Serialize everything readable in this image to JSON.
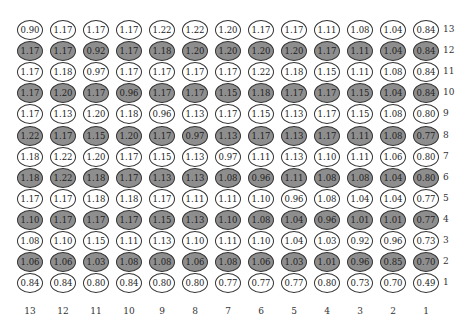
{
  "chart_data": {
    "type": "heatmap",
    "title": "",
    "column_labels": [
      "13",
      "12",
      "11",
      "10",
      "9",
      "8",
      "7",
      "6",
      "5",
      "4",
      "3",
      "2",
      "1"
    ],
    "row_labels": [
      "13",
      "12",
      "11",
      "10",
      "9",
      "8",
      "7",
      "6",
      "5",
      "4",
      "3",
      "2",
      "1"
    ],
    "shaded_rows": [
      "12",
      "10",
      "8",
      "6",
      "4",
      "2"
    ],
    "rows": [
      {
        "label": "13",
        "shaded": false,
        "values": [
          "0.90",
          "1.17",
          "1.17",
          "1.17",
          "1.22",
          "1.22",
          "1.20",
          "1.17",
          "1.17",
          "1.11",
          "1.08",
          "1.04",
          "0.84"
        ]
      },
      {
        "label": "12",
        "shaded": true,
        "values": [
          "1.17",
          "1.17",
          "0.92",
          "1.17",
          "1.18",
          "1.20",
          "1.20",
          "1.20",
          "1.20",
          "1.17",
          "1.11",
          "1.04",
          "0.84"
        ]
      },
      {
        "label": "11",
        "shaded": false,
        "values": [
          "1.17",
          "1.18",
          "0.97",
          "1.17",
          "1.17",
          "1.17",
          "1.17",
          "1.22",
          "1.18",
          "1.15",
          "1.11",
          "1.08",
          "0.84"
        ]
      },
      {
        "label": "10",
        "shaded": true,
        "values": [
          "1.17",
          "1.20",
          "1.17",
          "0.96",
          "1.17",
          "1.17",
          "1.15",
          "1.18",
          "1.17",
          "1.17",
          "1.15",
          "1.04",
          "0.84"
        ]
      },
      {
        "label": "9",
        "shaded": false,
        "values": [
          "1.17",
          "1.13",
          "1.20",
          "1.18",
          "0.96",
          "1.13",
          "1.17",
          "1.15",
          "1.13",
          "1.17",
          "1.15",
          "1.08",
          "0.80"
        ]
      },
      {
        "label": "8",
        "shaded": true,
        "values": [
          "1.22",
          "1.17",
          "1.15",
          "1.20",
          "1.17",
          "0.97",
          "1.13",
          "1.17",
          "1.13",
          "1.17",
          "1.11",
          "1.08",
          "0.77"
        ]
      },
      {
        "label": "7",
        "shaded": false,
        "values": [
          "1.18",
          "1.22",
          "1.20",
          "1.17",
          "1.15",
          "1.13",
          "0.97",
          "1.11",
          "1.13",
          "1.10",
          "1.11",
          "1.06",
          "0.80"
        ]
      },
      {
        "label": "6",
        "shaded": true,
        "values": [
          "1.18",
          "1.22",
          "1.18",
          "1.17",
          "1.13",
          "1.13",
          "1.08",
          "0.96",
          "1.11",
          "1.08",
          "1.08",
          "1.04",
          "0.80"
        ]
      },
      {
        "label": "5",
        "shaded": false,
        "values": [
          "1.17",
          "1.17",
          "1.18",
          "1.18",
          "1.17",
          "1.11",
          "1.11",
          "1.10",
          "0.96",
          "1.08",
          "1.04",
          "1.04",
          "0.77"
        ]
      },
      {
        "label": "4",
        "shaded": true,
        "values": [
          "1.10",
          "1.17",
          "1.17",
          "1.17",
          "1.15",
          "1.13",
          "1.10",
          "1.08",
          "1.04",
          "0.96",
          "1.01",
          "1.01",
          "0.77"
        ]
      },
      {
        "label": "3",
        "shaded": false,
        "values": [
          "1.08",
          "1.10",
          "1.15",
          "1.11",
          "1.13",
          "1.10",
          "1.11",
          "1.10",
          "1.04",
          "1.03",
          "0.92",
          "0.96",
          "0.73"
        ]
      },
      {
        "label": "2",
        "shaded": true,
        "values": [
          "1.06",
          "1.06",
          "1.03",
          "1.08",
          "1.08",
          "1.06",
          "1.08",
          "1.06",
          "1.03",
          "1.01",
          "0.96",
          "0.85",
          "0.70"
        ]
      },
      {
        "label": "1",
        "shaded": false,
        "values": [
          "0.84",
          "0.84",
          "0.80",
          "0.84",
          "0.80",
          "0.80",
          "0.77",
          "0.77",
          "0.77",
          "0.80",
          "0.73",
          "0.70",
          "0.49"
        ]
      }
    ]
  },
  "colors": {
    "shaded": "#8e8e8e",
    "unshaded": "#ffffff",
    "stroke": "#333333"
  },
  "layout": {
    "x0": 30,
    "dx": 33,
    "y0": 30,
    "dy": 21.1,
    "row_label_x": 443,
    "col_label_y": 306
  }
}
